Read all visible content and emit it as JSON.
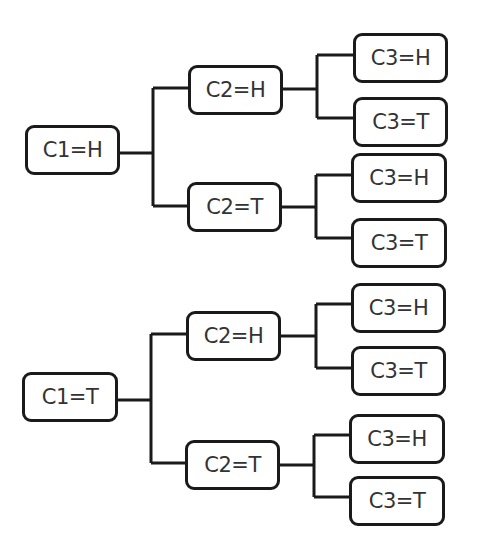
{
  "diagram": {
    "type": "tree",
    "colors": {
      "line": "#1a1a1a",
      "text": "#333333",
      "background": "#ffffff"
    },
    "nodes": [
      {
        "id": "c1h",
        "label": "C1=H",
        "x": 25,
        "y": 125,
        "w": 95,
        "h": 50
      },
      {
        "id": "c1h_c2h",
        "label": "C2=H",
        "x": 188,
        "y": 65,
        "w": 95,
        "h": 50
      },
      {
        "id": "c1h_c2t",
        "label": "C2=T",
        "x": 187,
        "y": 182,
        "w": 95,
        "h": 50
      },
      {
        "id": "c1h_c2h_c3h",
        "label": "C3=H",
        "x": 353,
        "y": 33,
        "w": 95,
        "h": 50
      },
      {
        "id": "c1h_c2h_c3t",
        "label": "C3=T",
        "x": 353,
        "y": 97,
        "w": 95,
        "h": 50
      },
      {
        "id": "c1h_c2t_c3h",
        "label": "C3=H",
        "x": 351,
        "y": 153,
        "w": 96,
        "h": 50
      },
      {
        "id": "c1h_c2t_c3t",
        "label": "C3=T",
        "x": 351,
        "y": 218,
        "w": 96,
        "h": 50
      },
      {
        "id": "c1t",
        "label": "C1=T",
        "x": 22,
        "y": 372,
        "w": 96,
        "h": 50
      },
      {
        "id": "c1t_c2h",
        "label": "C2=H",
        "x": 186,
        "y": 311,
        "w": 95,
        "h": 50
      },
      {
        "id": "c1t_c2t",
        "label": "C2=T",
        "x": 185,
        "y": 440,
        "w": 95,
        "h": 50
      },
      {
        "id": "c1t_c2h_c3h",
        "label": "C3=H",
        "x": 351,
        "y": 283,
        "w": 95,
        "h": 50
      },
      {
        "id": "c1t_c2h_c3t",
        "label": "C3=T",
        "x": 351,
        "y": 346,
        "w": 95,
        "h": 50
      },
      {
        "id": "c1t_c2t_c3h",
        "label": "C3=H",
        "x": 349,
        "y": 414,
        "w": 96,
        "h": 50
      },
      {
        "id": "c1t_c2t_c3t",
        "label": "C3=T",
        "x": 349,
        "y": 476,
        "w": 96,
        "h": 50
      }
    ]
  }
}
